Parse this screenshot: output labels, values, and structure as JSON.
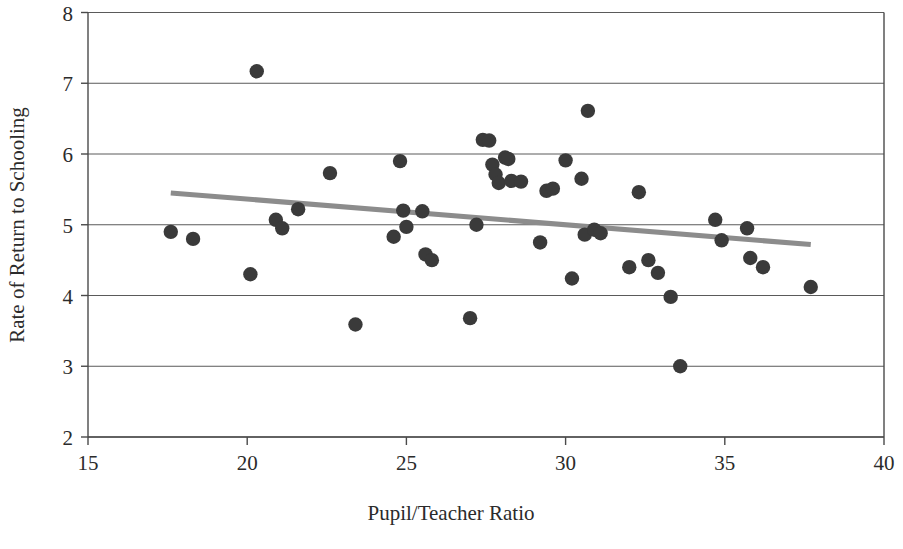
{
  "chart_data": {
    "type": "scatter",
    "title": "",
    "xlabel": "Pupil/Teacher Ratio",
    "ylabel": "Rate of Return to Schooling",
    "xlim": [
      15,
      40
    ],
    "ylim": [
      2,
      8
    ],
    "xticks": [
      15,
      20,
      25,
      30,
      35,
      40
    ],
    "yticks": [
      2,
      3,
      4,
      5,
      6,
      7,
      8
    ],
    "xtick_labels": [
      "15",
      "20",
      "25",
      "30",
      "35",
      "40"
    ],
    "ytick_labels": [
      "2",
      "3",
      "4",
      "5",
      "6",
      "7",
      "8"
    ],
    "grid": "horizontal",
    "legend": "none",
    "marker_color": "#3a3a3a",
    "marker_size": 7.2,
    "trendline": {
      "label": "linear fit",
      "color": "#8c8c8c",
      "width": 5,
      "x0": 17.6,
      "y0": 5.45,
      "x1": 37.7,
      "y1": 4.72
    },
    "points": [
      {
        "x": 17.6,
        "y": 4.9
      },
      {
        "x": 18.3,
        "y": 4.8
      },
      {
        "x": 20.1,
        "y": 4.3
      },
      {
        "x": 20.3,
        "y": 7.17
      },
      {
        "x": 20.9,
        "y": 5.07
      },
      {
        "x": 21.1,
        "y": 4.95
      },
      {
        "x": 21.6,
        "y": 5.22
      },
      {
        "x": 22.6,
        "y": 5.73
      },
      {
        "x": 23.4,
        "y": 3.59
      },
      {
        "x": 24.6,
        "y": 4.83
      },
      {
        "x": 24.8,
        "y": 5.9
      },
      {
        "x": 24.9,
        "y": 5.2
      },
      {
        "x": 25.0,
        "y": 4.97
      },
      {
        "x": 25.5,
        "y": 5.19
      },
      {
        "x": 25.6,
        "y": 4.58
      },
      {
        "x": 25.8,
        "y": 4.5
      },
      {
        "x": 27.0,
        "y": 3.68
      },
      {
        "x": 27.2,
        "y": 5.0
      },
      {
        "x": 27.4,
        "y": 6.2
      },
      {
        "x": 27.6,
        "y": 6.19
      },
      {
        "x": 27.7,
        "y": 5.85
      },
      {
        "x": 27.8,
        "y": 5.71
      },
      {
        "x": 27.9,
        "y": 5.59
      },
      {
        "x": 28.1,
        "y": 5.95
      },
      {
        "x": 28.2,
        "y": 5.93
      },
      {
        "x": 28.3,
        "y": 5.62
      },
      {
        "x": 28.6,
        "y": 5.61
      },
      {
        "x": 29.2,
        "y": 4.75
      },
      {
        "x": 29.4,
        "y": 5.48
      },
      {
        "x": 29.6,
        "y": 5.51
      },
      {
        "x": 30.0,
        "y": 5.91
      },
      {
        "x": 30.2,
        "y": 4.24
      },
      {
        "x": 30.5,
        "y": 5.65
      },
      {
        "x": 30.6,
        "y": 4.86
      },
      {
        "x": 30.7,
        "y": 6.61
      },
      {
        "x": 30.9,
        "y": 4.93
      },
      {
        "x": 31.1,
        "y": 4.88
      },
      {
        "x": 32.0,
        "y": 4.4
      },
      {
        "x": 32.3,
        "y": 5.46
      },
      {
        "x": 32.6,
        "y": 4.5
      },
      {
        "x": 32.9,
        "y": 4.32
      },
      {
        "x": 33.3,
        "y": 3.98
      },
      {
        "x": 33.6,
        "y": 3.0
      },
      {
        "x": 34.7,
        "y": 5.07
      },
      {
        "x": 34.9,
        "y": 4.78
      },
      {
        "x": 35.7,
        "y": 4.95
      },
      {
        "x": 35.8,
        "y": 4.53
      },
      {
        "x": 36.2,
        "y": 4.4
      },
      {
        "x": 37.7,
        "y": 4.12
      }
    ]
  }
}
